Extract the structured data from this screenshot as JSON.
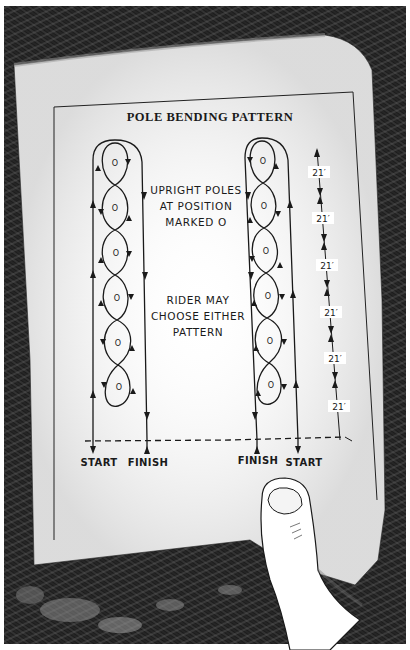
{
  "diagram": {
    "title": "POLE BENDING PATTERN",
    "notes": {
      "poles_note": [
        "UPRIGHT POLES",
        "AT POSITION",
        "MARKED O"
      ],
      "rider_note": [
        "RIDER MAY",
        "CHOOSE EITHER",
        "PATTERN"
      ]
    },
    "pole_marker": "O",
    "pole_count_per_pattern": 6,
    "patterns": [
      {
        "id": "left",
        "labels": {
          "entry": "START",
          "exit": "FINISH"
        },
        "entry_side": "left",
        "exit_side": "right"
      },
      {
        "id": "right",
        "labels": {
          "exit": "FINISH",
          "entry": "START"
        },
        "entry_side": "right",
        "exit_side": "left"
      }
    ],
    "dimensions": {
      "spacing_label": "21′",
      "segments": [
        "21′",
        "21′",
        "21′",
        "21′",
        "21′",
        "21′"
      ]
    },
    "line_styles": {
      "start_line": "dashed"
    },
    "colors": {
      "ink": "#1a1a1a",
      "paper": "#ffffff",
      "background": "#2a2a2a"
    }
  },
  "illustration": {
    "description_items": [
      "paper-sheet",
      "thumb-holding-paper",
      "dark-textured-background"
    ]
  }
}
